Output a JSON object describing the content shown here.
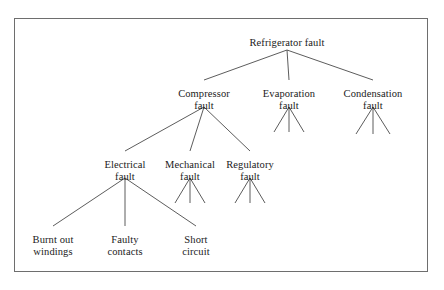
{
  "diagram": {
    "style": {
      "background": "#ffffff",
      "frame_color": "#6e6e6e",
      "line_color": "#4a4a4a",
      "text_color": "#1a1a1a"
    },
    "nodes": [
      {
        "id": "root",
        "label": "Refrigerator fault",
        "x": 287,
        "y": 37,
        "level": 0
      },
      {
        "id": "compressor",
        "label": "Compressor\nfault",
        "x": 204,
        "y": 88,
        "level": 1
      },
      {
        "id": "evaporation",
        "label": "Evaporation\nfault",
        "x": 289,
        "y": 88,
        "level": 1
      },
      {
        "id": "condensation",
        "label": "Condensation\nfault",
        "x": 373,
        "y": 88,
        "level": 1
      },
      {
        "id": "electrical",
        "label": "Electrical\nfault",
        "x": 125,
        "y": 159,
        "level": 2
      },
      {
        "id": "mechanical",
        "label": "Mechanical\nfault",
        "x": 190,
        "y": 159,
        "level": 2
      },
      {
        "id": "regulatory",
        "label": "Regulatory\nfault",
        "x": 250,
        "y": 159,
        "level": 2
      },
      {
        "id": "burnt",
        "label": "Burnt out\nwindings",
        "x": 53,
        "y": 234,
        "level": 3
      },
      {
        "id": "faulty",
        "label": "Faulty\ncontacts",
        "x": 125,
        "y": 234,
        "level": 3
      },
      {
        "id": "short",
        "label": "Short\ncircuit",
        "x": 196,
        "y": 234,
        "level": 3
      }
    ],
    "edges": [
      {
        "from": "root",
        "to": "compressor",
        "x1": 287,
        "y1": 50,
        "x2": 204,
        "y2": 80
      },
      {
        "from": "root",
        "to": "evaporation",
        "x1": 287,
        "y1": 50,
        "x2": 289,
        "y2": 80
      },
      {
        "from": "root",
        "to": "condensation",
        "x1": 287,
        "y1": 50,
        "x2": 373,
        "y2": 80
      },
      {
        "from": "compressor",
        "to": "electrical",
        "x1": 204,
        "y1": 107,
        "x2": 125,
        "y2": 151
      },
      {
        "from": "compressor",
        "to": "mechanical",
        "x1": 204,
        "y1": 107,
        "x2": 190,
        "y2": 151
      },
      {
        "from": "compressor",
        "to": "regulatory",
        "x1": 204,
        "y1": 107,
        "x2": 250,
        "y2": 151
      },
      {
        "from": "electrical",
        "to": "burnt",
        "x1": 125,
        "y1": 178,
        "x2": 53,
        "y2": 226
      },
      {
        "from": "electrical",
        "to": "faulty",
        "x1": 125,
        "y1": 178,
        "x2": 125,
        "y2": 226
      },
      {
        "from": "electrical",
        "to": "short",
        "x1": 125,
        "y1": 178,
        "x2": 196,
        "y2": 226
      }
    ],
    "stubs": [
      {
        "parent": "evaporation",
        "x1": 289,
        "y1": 107,
        "x2": 274,
        "y2": 132
      },
      {
        "parent": "evaporation",
        "x1": 289,
        "y1": 107,
        "x2": 289,
        "y2": 132
      },
      {
        "parent": "evaporation",
        "x1": 289,
        "y1": 107,
        "x2": 304,
        "y2": 132
      },
      {
        "parent": "condensation",
        "x1": 373,
        "y1": 107,
        "x2": 356,
        "y2": 134
      },
      {
        "parent": "condensation",
        "x1": 373,
        "y1": 107,
        "x2": 373,
        "y2": 134
      },
      {
        "parent": "condensation",
        "x1": 373,
        "y1": 107,
        "x2": 390,
        "y2": 134
      },
      {
        "parent": "mechanical",
        "x1": 190,
        "y1": 178,
        "x2": 175,
        "y2": 203
      },
      {
        "parent": "mechanical",
        "x1": 190,
        "y1": 178,
        "x2": 190,
        "y2": 203
      },
      {
        "parent": "mechanical",
        "x1": 190,
        "y1": 178,
        "x2": 205,
        "y2": 203
      },
      {
        "parent": "regulatory",
        "x1": 250,
        "y1": 178,
        "x2": 235,
        "y2": 203
      },
      {
        "parent": "regulatory",
        "x1": 250,
        "y1": 178,
        "x2": 250,
        "y2": 203
      },
      {
        "parent": "regulatory",
        "x1": 250,
        "y1": 178,
        "x2": 265,
        "y2": 203
      }
    ]
  }
}
